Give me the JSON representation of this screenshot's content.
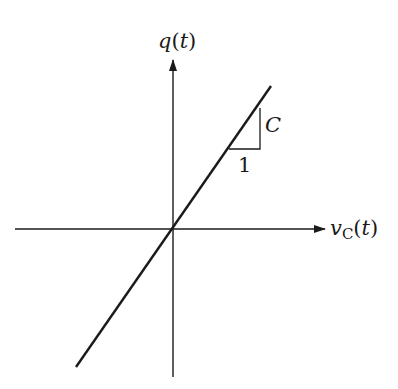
{
  "diagram": {
    "y_axis_label": {
      "var": "q",
      "paren_open": "(",
      "arg": "t",
      "paren_close": ")"
    },
    "x_axis_label": {
      "var": "v",
      "sub": "C",
      "paren_open": "(",
      "arg": "t",
      "paren_close": ")"
    },
    "slope_triangle": {
      "run_label": "1",
      "rise_label": "C"
    },
    "colors": {
      "ink": "#1a1a1a",
      "background": "#ffffff"
    }
  }
}
